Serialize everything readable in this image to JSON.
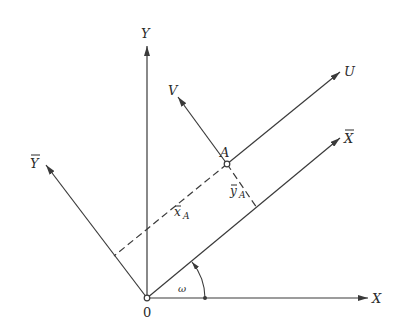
{
  "diagram": {
    "colors": {
      "line": "#3a3a3a",
      "text": "#2a2a2a",
      "background": "#ffffff"
    },
    "origin": {
      "label": "0",
      "x": 147,
      "y": 298
    },
    "axes": [
      {
        "id": "X",
        "label": "X",
        "from": [
          147,
          298
        ],
        "to": [
          368,
          298
        ],
        "label_pos": [
          373,
          303
        ]
      },
      {
        "id": "Y",
        "label": "Y",
        "from": [
          147,
          298
        ],
        "to": [
          147,
          46
        ],
        "label_pos": [
          141,
          38
        ]
      },
      {
        "id": "Xbar",
        "label": "X",
        "overbar": true,
        "from": [
          147,
          298
        ],
        "to": [
          340,
          138
        ],
        "label_pos": [
          345,
          140
        ]
      },
      {
        "id": "Ybar",
        "label": "Y",
        "overbar": true,
        "from": [
          147,
          298
        ],
        "to": [
          46,
          165
        ],
        "label_pos": [
          30,
          166
        ]
      },
      {
        "id": "U",
        "label": "U",
        "from": [
          227,
          164
        ],
        "to": [
          340,
          72
        ],
        "label_pos": [
          345,
          76
        ]
      },
      {
        "id": "V",
        "label": "V",
        "from": [
          227,
          164
        ],
        "to": [
          178,
          97
        ],
        "label_pos": [
          168,
          94
        ]
      }
    ],
    "point_A": {
      "label": "A",
      "x": 227,
      "y": 164,
      "label_pos": [
        220,
        156
      ]
    },
    "projections": [
      {
        "id": "xA",
        "label": "x",
        "overbar": true,
        "subscript": "A",
        "from": [
          227,
          164
        ],
        "to": [
          114,
          256
        ],
        "label_pos": [
          174,
          216
        ]
      },
      {
        "id": "yA",
        "label": "y",
        "overbar": true,
        "subscript": "A",
        "from": [
          227,
          164
        ],
        "to": [
          257,
          208
        ],
        "label_pos": [
          231,
          195
        ]
      }
    ],
    "angle": {
      "label": "ω",
      "center": [
        147,
        298
      ],
      "radius": 58,
      "label_pos": [
        178,
        291
      ]
    }
  }
}
